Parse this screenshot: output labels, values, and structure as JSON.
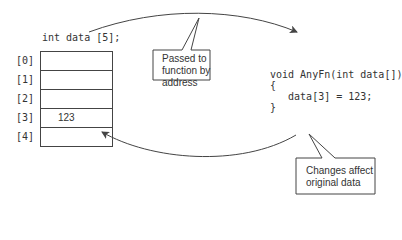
{
  "declaration": "int data [5];",
  "array": {
    "indices": [
      "[0]",
      "[1]",
      "[2]",
      "[3]",
      "[4]"
    ],
    "values": [
      "",
      "",
      "",
      "123",
      ""
    ]
  },
  "function_code": {
    "lines": [
      "void AnyFn(int data[])",
      "{",
      "   data[3] = 123;",
      "}"
    ]
  },
  "callouts": [
    {
      "lines": [
        "Passed to",
        "function by",
        "address"
      ]
    },
    {
      "lines": [
        "Changes affect",
        "original data"
      ]
    }
  ],
  "colors": {
    "line": "#444444",
    "text": "#333333",
    "background": "#ffffff"
  }
}
